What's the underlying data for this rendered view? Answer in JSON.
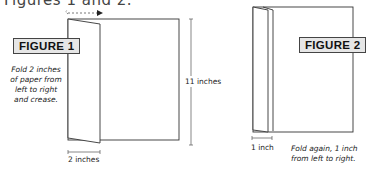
{
  "heading": "Figures 1 and 2.",
  "figure1": {
    "label": "FIGURE 1",
    "instruction_lines": [
      "Fold 2 inches",
      "of paper from",
      "left to right",
      "and crease."
    ],
    "width_dim": "2 inches",
    "height_dim": "11 inches"
  },
  "figure2": {
    "label": "FIGURE 2",
    "instruction_lines": [
      "Fold again, 1 inch",
      "from left to right."
    ],
    "width_dim": "1 inch"
  },
  "colors": {
    "line": "#333333",
    "label_bg": "#e6e6e6",
    "arrow": "#222222"
  }
}
